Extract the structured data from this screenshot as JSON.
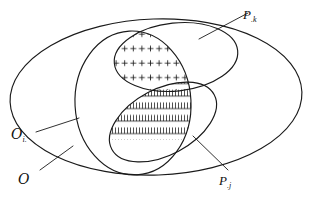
{
  "figure": {
    "kind": "set-venn-diagram",
    "background_color": "#ffffff",
    "stroke_color": "#1a1a1a",
    "labels": {
      "outer_set": {
        "base": "O",
        "sub": ""
      },
      "inner_set": {
        "base": "O",
        "sub": "i."
      },
      "upper_block": {
        "base": "P",
        "sub": ".k"
      },
      "lower_block": {
        "base": "P",
        "sub": ".j"
      }
    },
    "regions": [
      {
        "name": "outer-ellipse",
        "label": "O",
        "hatch": "none"
      },
      {
        "name": "inner-ellipse",
        "label": "O i.",
        "hatch": "none"
      },
      {
        "name": "upper-ellipse",
        "label": "P .k",
        "hatch": "plus-signs",
        "hatch_rows": 3
      },
      {
        "name": "lower-ellipse",
        "label": "P .j",
        "hatch": "comb-ticks",
        "hatch_rows": 4
      }
    ],
    "leader_lines": [
      {
        "name": "leader-p-k",
        "from": "upper-ellipse-boundary",
        "to": "label-p-k"
      },
      {
        "name": "leader-p-j",
        "from": "lower-ellipse-boundary",
        "to": "label-p-j"
      },
      {
        "name": "leader-o-i",
        "from": "inner-ellipse-boundary",
        "to": "label-o-i"
      },
      {
        "name": "leader-o",
        "from": "outer-ellipse-boundary",
        "to": "label-o"
      }
    ]
  }
}
